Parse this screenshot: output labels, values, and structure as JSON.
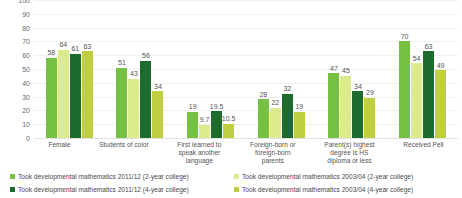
{
  "chart_data": {
    "type": "bar",
    "title": "",
    "subtitle": "",
    "xlabel": "",
    "ylabel": "",
    "ylim": [
      0,
      100
    ],
    "ytick_step": 10,
    "yticks": [
      100,
      90,
      80,
      70,
      60,
      50,
      40,
      30,
      20,
      10,
      0
    ],
    "grid": true,
    "legend_position": "bottom",
    "categories": [
      "Female",
      "Students of color",
      "First learned to speak another language",
      "Foreign-born or foreign-born parents",
      "Parent(s) highest degree is HS diploma or less",
      "Received Pell"
    ],
    "category_lines": [
      [
        "Female"
      ],
      [
        "Students of color"
      ],
      [
        "First learned to",
        "speak another",
        "language"
      ],
      [
        "Foreign-born or",
        "foreign-born",
        "parents"
      ],
      [
        "Parent(s) highest",
        "degree is HS",
        "diploma or less"
      ],
      [
        "Received Pell"
      ]
    ],
    "series": [
      {
        "name": "Took developmental mathematics 2011/12 (2-year college)",
        "color": "#76c043",
        "values": [
          58,
          51,
          19,
          28,
          47,
          70
        ],
        "labels": [
          "58",
          "51",
          "19",
          "28",
          "47",
          "70"
        ]
      },
      {
        "name": "Took developmental mathematics 2003/04 (2-year college)",
        "color": "#ddeb8f",
        "values": [
          64,
          43,
          9.7,
          22,
          45,
          54
        ],
        "labels": [
          "64",
          "43",
          "9.7",
          "22",
          "45",
          "54"
        ]
      },
      {
        "name": "Took developmental mathematics 2011/12 (4-year college)",
        "color": "#1e6b2e",
        "values": [
          61,
          56,
          19.5,
          32,
          34,
          63
        ],
        "labels": [
          "61",
          "56",
          "19.5",
          "32",
          "34",
          "63"
        ]
      },
      {
        "name": "Took developmental mathematics 2003/04 (4-year college)",
        "color": "#c0cf3f",
        "values": [
          63,
          34,
          10.5,
          19,
          29,
          49
        ],
        "labels": [
          "63",
          "34",
          "10.5",
          "19",
          "29",
          "49"
        ]
      }
    ],
    "legend_order": [
      0,
      1,
      2,
      3
    ]
  }
}
